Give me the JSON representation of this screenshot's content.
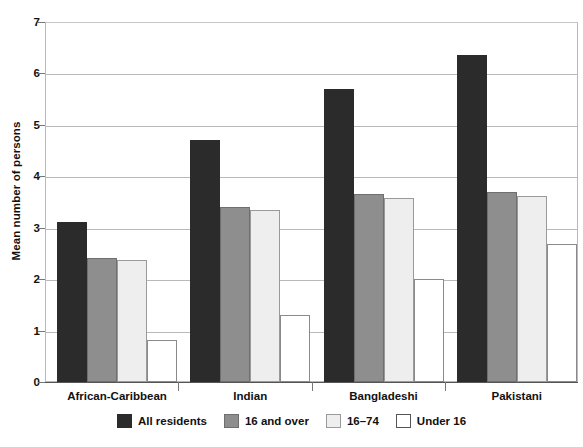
{
  "chart_data": {
    "type": "bar",
    "title": "",
    "xlabel": "",
    "ylabel": "Mean number of persons",
    "ylim": [
      0,
      7
    ],
    "yticks": [
      0,
      1,
      2,
      3,
      4,
      5,
      6,
      7
    ],
    "ytick_labels": [
      "0",
      "1",
      "2",
      "3",
      "4",
      "5",
      "6",
      "7"
    ],
    "grid": true,
    "legend_position": "bottom",
    "categories": [
      "African-Caribbean",
      "Indian",
      "Bangladeshi",
      "Pakistani"
    ],
    "series": [
      {
        "name": "All residents",
        "color": "#2b2b2b",
        "values": [
          3.12,
          4.7,
          5.7,
          6.35
        ]
      },
      {
        "name": "16 and over",
        "color": "#8e8e8e",
        "values": [
          2.41,
          3.4,
          3.65,
          3.7
        ]
      },
      {
        "name": "16–74",
        "color": "#eeeeee",
        "values": [
          2.37,
          3.35,
          3.57,
          3.61
        ]
      },
      {
        "name": "Under 16",
        "color": "#ffffff",
        "values": [
          0.81,
          1.3,
          2.0,
          2.68
        ]
      }
    ]
  },
  "axis": {
    "y_title": "Mean number of persons"
  },
  "colors": {
    "all_residents": "#2b2b2b",
    "sixteen_and_over": "#8e8e8e",
    "sixteen_to_74": "#eeeeee",
    "under_16": "#ffffff",
    "gridline": "#b9b9b9",
    "axis": "#555555",
    "text": "#111111"
  }
}
